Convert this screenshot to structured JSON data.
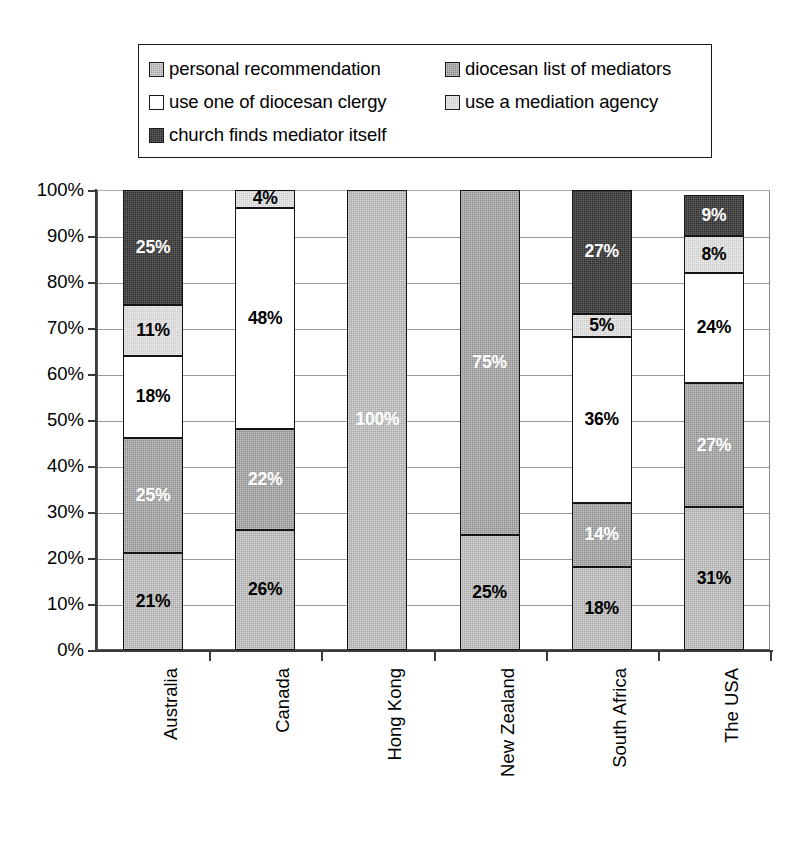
{
  "chart_data": {
    "type": "bar",
    "variant": "stacked-percent",
    "title": "",
    "subtitle": "",
    "xlabel": "",
    "ylabel": "",
    "ylim": [
      0,
      100
    ],
    "yticks": [
      "0%",
      "10%",
      "20%",
      "30%",
      "40%",
      "50%",
      "60%",
      "70%",
      "80%",
      "90%",
      "100%"
    ],
    "ytick_values": [
      0,
      10,
      20,
      30,
      40,
      50,
      60,
      70,
      80,
      90,
      100
    ],
    "grid": true,
    "legend_position": "top",
    "categories": [
      "Australia",
      "Canada",
      "Hong Kong",
      "New Zealand",
      "South Africa",
      "The USA"
    ],
    "series": [
      {
        "name": "personal recommendation",
        "color": "#a5a5a5",
        "swatch": "fill-s1",
        "values": [
          21,
          26,
          100,
          25,
          18,
          31
        ],
        "labels": [
          "21%",
          "26%",
          "100%",
          "25%",
          "18%",
          "31%"
        ],
        "label_colors": [
          "dark",
          "dark",
          "light",
          "dark",
          "dark",
          "dark"
        ]
      },
      {
        "name": "diocesan list of mediators",
        "color": "#8c8c8c",
        "swatch": "fill-s2",
        "values": [
          25,
          22,
          0,
          75,
          14,
          27
        ],
        "labels": [
          "25%",
          "22%",
          "",
          "75%",
          "14%",
          "27%"
        ],
        "label_colors": [
          "light",
          "light",
          "light",
          "light",
          "light",
          "light"
        ]
      },
      {
        "name": "use one of diocesan clergy",
        "color": "#ffffff",
        "swatch": "fill-s3",
        "values": [
          18,
          48,
          0,
          0,
          36,
          24
        ],
        "labels": [
          "18%",
          "48%",
          "",
          "",
          "36%",
          "24%"
        ],
        "label_colors": [
          "dark",
          "dark",
          "dark",
          "dark",
          "dark",
          "dark"
        ]
      },
      {
        "name": "use a mediation agency",
        "color": "#cdcdcd",
        "swatch": "fill-s4",
        "values": [
          11,
          4,
          0,
          0,
          5,
          8
        ],
        "labels": [
          "11%",
          "4%",
          "",
          "",
          "5%",
          "8%"
        ],
        "label_colors": [
          "dark",
          "dark",
          "dark",
          "dark",
          "dark",
          "dark"
        ]
      },
      {
        "name": "church finds mediator itself",
        "color": "#2b2b2b",
        "swatch": "fill-s5",
        "values": [
          25,
          0,
          0,
          0,
          27,
          9
        ],
        "labels": [
          "25%",
          "",
          "",
          "",
          "27%",
          "9%"
        ],
        "label_colors": [
          "light",
          "light",
          "light",
          "light",
          "light",
          "light"
        ]
      }
    ]
  },
  "legend": {
    "rows": [
      [
        {
          "label": "personal recommendation",
          "swatch": "fill-s1"
        },
        {
          "label": "diocesan list of mediators",
          "swatch": "fill-s2"
        }
      ],
      [
        {
          "label": "use one of diocesan clergy",
          "swatch": "fill-s3"
        },
        {
          "label": "use a mediation agency",
          "swatch": "fill-s4"
        }
      ],
      [
        {
          "label": "church finds mediator itself",
          "swatch": "fill-s5"
        }
      ]
    ]
  }
}
